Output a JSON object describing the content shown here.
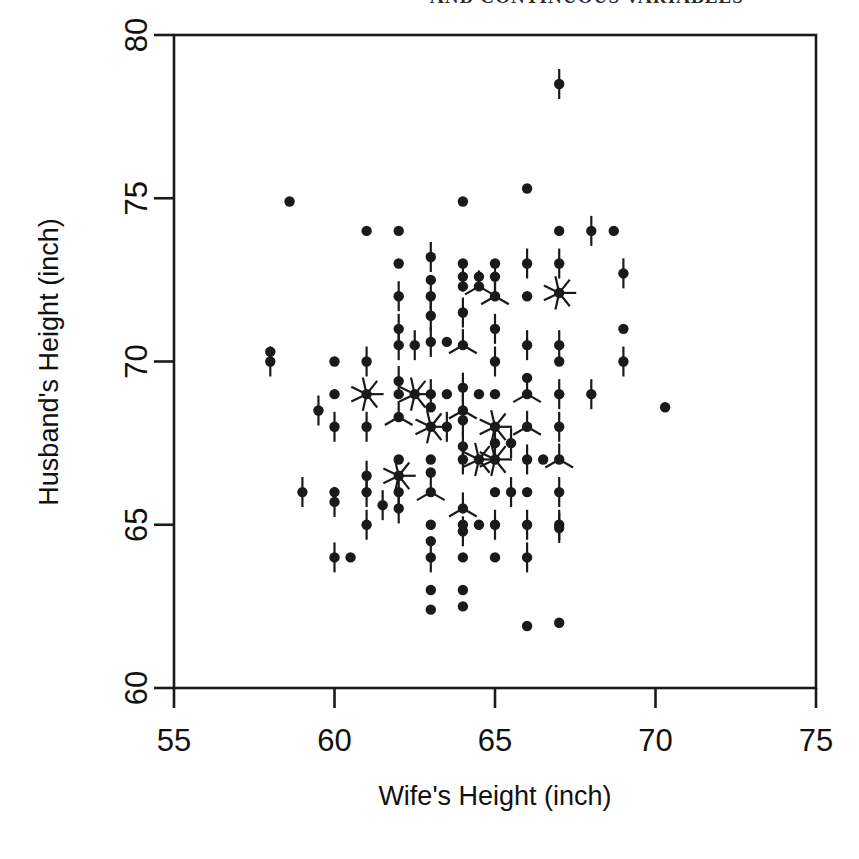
{
  "figure": {
    "clipped_header_text": "AND CONTINUOUS VARIABLES",
    "background_color": "#ffffff",
    "ink_color": "#1a1a1a"
  },
  "chart_data": {
    "type": "scatter",
    "title": "",
    "subtitle": "",
    "xlabel": "Wife's Height (inch)",
    "ylabel": "Husband's Height (inch)",
    "xlim": [
      55,
      75
    ],
    "ylim": [
      60,
      80
    ],
    "xticks": [
      55,
      60,
      65,
      70,
      75
    ],
    "yticks": [
      60,
      65,
      70,
      75,
      80
    ],
    "xticklabels": [
      "55",
      "60",
      "65",
      "70",
      "75"
    ],
    "yticklabels": [
      "60",
      "65",
      "70",
      "75",
      "80"
    ],
    "grid": false,
    "legend": null,
    "marker_style": "sunflower",
    "marker_note": "Each marker is a filled dot; radiating line petals encode the number of coincident observations at that (x, y) pair.",
    "x": [
      67.0,
      58.6,
      64.0,
      61.0,
      62.0,
      62.0,
      66.0,
      67.0,
      63.0,
      64.0,
      65.0,
      66.0,
      68.0,
      63.0,
      64.0,
      64.5,
      65.0,
      67.0,
      68.7,
      62.0,
      63.0,
      64.0,
      64.5,
      65.0,
      66.0,
      67.0,
      69.0,
      62.0,
      63.0,
      64.0,
      65.0,
      69.0,
      58.0,
      60.0,
      61.0,
      62.0,
      62.5,
      63.0,
      63.5,
      64.0,
      65.0,
      66.0,
      67.0,
      69.0,
      58.0,
      60.0,
      61.0,
      62.0,
      63.0,
      63.5,
      64.0,
      64.5,
      65.0,
      66.0,
      67.0,
      69.0,
      59.5,
      60.0,
      61.0,
      62.0,
      62.5,
      63.0,
      64.0,
      65.0,
      66.0,
      67.0,
      68.0,
      70.3,
      60.0,
      61.0,
      62.0,
      63.0,
      63.5,
      64.0,
      65.0,
      66.0,
      67.0,
      59.0,
      61.0,
      62.0,
      63.0,
      64.0,
      65.0,
      65.5,
      66.0,
      67.0,
      60.0,
      61.0,
      62.0,
      63.0,
      64.0,
      64.5,
      65.0,
      66.0,
      66.5,
      67.0,
      60.0,
      61.5,
      62.0,
      63.0,
      64.0,
      65.0,
      65.5,
      66.0,
      67.0,
      60.0,
      62.0,
      63.0,
      64.0,
      64.5,
      65.0,
      66.0,
      67.0,
      60.0,
      61.0,
      63.0,
      64.0,
      65.0,
      66.0,
      67.0,
      60.5,
      63.0,
      64.0,
      65.0,
      66.0,
      67.0,
      63.0,
      64.0,
      63.0,
      64.0,
      66.0
    ],
    "y": [
      78.5,
      74.9,
      74.9,
      74.0,
      74.0,
      73.0,
      75.3,
      74.0,
      73.2,
      73.0,
      73.0,
      73.0,
      74.0,
      72.5,
      72.6,
      72.6,
      72.6,
      73.0,
      74.0,
      72.0,
      72.0,
      72.3,
      72.3,
      72.0,
      72.0,
      72.1,
      72.7,
      71.0,
      71.4,
      71.5,
      71.0,
      71.0,
      70.3,
      70.0,
      70.0,
      70.5,
      70.5,
      70.6,
      70.6,
      70.5,
      70.0,
      70.5,
      70.5,
      70.0,
      70.0,
      69.0,
      69.0,
      69.4,
      69.0,
      69.0,
      69.2,
      69.0,
      70.0,
      69.5,
      70.0,
      70.0,
      68.5,
      68.0,
      68.0,
      69.0,
      69.0,
      68.6,
      68.5,
      69.0,
      69.0,
      69.0,
      69.0,
      68.6,
      68.0,
      68.0,
      68.3,
      68.0,
      68.0,
      68.2,
      68.0,
      68.0,
      69.0,
      66.0,
      66.5,
      67.0,
      67.0,
      67.4,
      67.5,
      67.5,
      67.0,
      68.0,
      66.0,
      66.0,
      66.5,
      66.6,
      67.0,
      67.0,
      67.0,
      67.0,
      67.0,
      67.0,
      65.7,
      65.6,
      66.0,
      66.0,
      65.5,
      66.0,
      66.0,
      66.0,
      66.0,
      64.0,
      65.5,
      65.0,
      65.0,
      65.0,
      65.0,
      65.0,
      65.0,
      64.0,
      65.0,
      64.5,
      64.8,
      65.0,
      65.0,
      64.9,
      64.0,
      64.0,
      64.0,
      64.0,
      64.0,
      62.0,
      63.0,
      63.0,
      62.4,
      62.5,
      61.9
    ],
    "n_points_approx": 130
  },
  "axes": {
    "x_axis_name": "x-axis",
    "y_axis_name": "y-axis"
  }
}
